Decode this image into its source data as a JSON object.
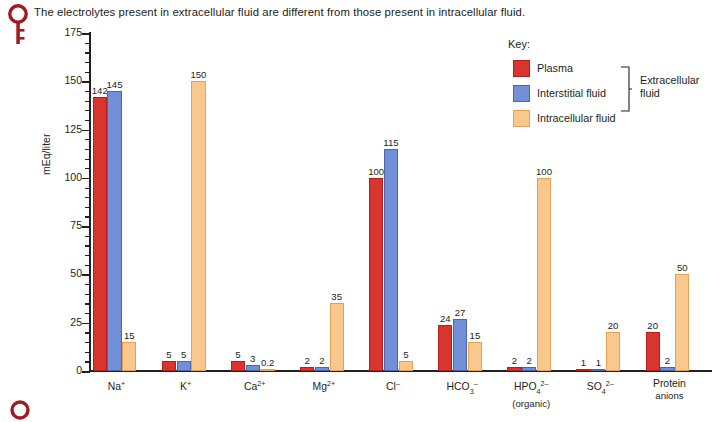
{
  "caption": {
    "text": "The electrolytes present in extracellular fluid are different from those present in intracellular fluid.",
    "icon": "key-icon"
  },
  "bottom_marker": {
    "icon": "circle-marker-icon"
  },
  "legend": {
    "title": "Key:",
    "entries": [
      {
        "label": "Plasma",
        "color": "#d8352f",
        "swatch": "plasma-swatch"
      },
      {
        "label": "Interstitial fluid",
        "color": "#7190d8",
        "swatch": "interstitial-swatch"
      },
      {
        "label": "Intracellular fluid",
        "color": "#fac88c",
        "swatch": "intracellular-swatch"
      }
    ],
    "group_bracket_label_line1": "Extracellular",
    "group_bracket_label_line2": "fluid"
  },
  "chart_data": {
    "type": "bar",
    "title": "The electrolytes present in extracellular fluid are different from those present in intracellular fluid.",
    "xlabel": "",
    "ylabel": "mEq/liter",
    "ylim": [
      0,
      175
    ],
    "ytick_labels": [
      "0",
      "25",
      "50",
      "75",
      "100",
      "125",
      "150",
      "175"
    ],
    "ytick_values": [
      0,
      25,
      50,
      75,
      100,
      125,
      150,
      175
    ],
    "yminor_step": 5,
    "grid": false,
    "legend_position": "upper-right-inside",
    "categories": [
      "Na+",
      "K+",
      "Ca2+",
      "Mg2+",
      "Cl-",
      "HCO3-",
      "HPO4 2- (organic)",
      "SO4 2-",
      "Protein anions"
    ],
    "category_labels_html": [
      {
        "main": "Na",
        "sup": "+",
        "sub": "",
        "second_line": ""
      },
      {
        "main": "K",
        "sup": "+",
        "sub": "",
        "second_line": ""
      },
      {
        "main": "Ca",
        "sup": "2+",
        "sub": "",
        "second_line": ""
      },
      {
        "main": "Mg",
        "sup": "2+",
        "sub": "",
        "second_line": ""
      },
      {
        "main": "Cl",
        "sup": "–",
        "sub": "",
        "second_line": ""
      },
      {
        "main": "HCO",
        "sup": "–",
        "sub": "3",
        "second_line": ""
      },
      {
        "main": "HPO",
        "sup": "2–",
        "sub": "4",
        "second_line": "(organic)"
      },
      {
        "main": "SO",
        "sup": "2–",
        "sub": "4",
        "second_line": ""
      },
      {
        "main": "Protein",
        "sup": "",
        "sub": "",
        "second_line": "anions"
      }
    ],
    "series": [
      {
        "name": "Plasma",
        "color": "#d8352f",
        "values": [
          142,
          5,
          5,
          2,
          100,
          24,
          2,
          1,
          20
        ],
        "labels": [
          "142",
          "5",
          "5",
          "2",
          "100",
          "24",
          "2",
          "1",
          "20"
        ]
      },
      {
        "name": "Interstitial fluid",
        "color": "#7190d8",
        "values": [
          145,
          5,
          3,
          2,
          115,
          27,
          2,
          1,
          2
        ],
        "labels": [
          "145",
          "5",
          "3",
          "2",
          "115",
          "27",
          "2",
          "1",
          "2"
        ]
      },
      {
        "name": "Intracellular fluid",
        "color": "#fac88c",
        "values": [
          15,
          150,
          0.2,
          35,
          5,
          15,
          100,
          20,
          50
        ],
        "labels": [
          "15",
          "150",
          "0.2",
          "35",
          "5",
          "15",
          "100",
          "20",
          "50"
        ]
      }
    ]
  }
}
